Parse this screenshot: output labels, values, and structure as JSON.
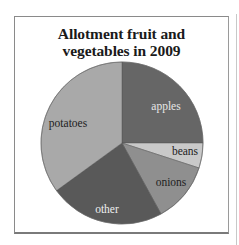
{
  "chart_data": {
    "type": "pie",
    "title": "Allotment fruit and vegetables in 2009",
    "title_lines": [
      "Allotment fruit and",
      "vegetables in 2009"
    ],
    "start_angle_deg": 0,
    "direction": "clockwise",
    "legend": "none (labels inside slices)",
    "categories": [
      "apples",
      "beans",
      "onions",
      "other",
      "potatoes"
    ],
    "values": [
      25,
      5,
      12,
      23,
      35
    ],
    "unit": "percent (estimated from slice angles)",
    "colors": [
      "#666666",
      "#c9c9c9",
      "#8f8f8f",
      "#595959",
      "#a9a9a9"
    ],
    "label_colors": [
      "#e6e6e6",
      "#222222",
      "#222222",
      "#eeeeee",
      "#222222"
    ],
    "label_positions": [
      [
        166,
        110
      ],
      [
        185,
        155
      ],
      [
        171,
        186
      ],
      [
        107,
        213
      ],
      [
        68,
        127
      ]
    ]
  }
}
